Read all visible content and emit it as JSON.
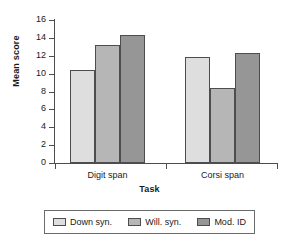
{
  "chart_data": {
    "type": "bar",
    "title": "",
    "xlabel": "Task",
    "ylabel": "Mean score",
    "categories": [
      "Digit span",
      "Corsi span"
    ],
    "series": [
      {
        "name": "Down syn.",
        "values": [
          10.4,
          11.9
        ],
        "color": "#dedede"
      },
      {
        "name": "Will. syn.",
        "values": [
          13.2,
          8.4
        ],
        "color": "#b6b6b6"
      },
      {
        "name": "Mod. ID",
        "values": [
          14.3,
          12.3
        ],
        "color": "#969696"
      }
    ],
    "ylim": [
      0,
      16
    ],
    "ytick_step": 2,
    "yticks": [
      0,
      2,
      4,
      6,
      8,
      10,
      12,
      14,
      16
    ],
    "ytick_labels": [
      "0",
      "2",
      "4",
      "6",
      "8",
      "10",
      "12",
      "14",
      "16"
    ],
    "grid": false,
    "legend_position": "bottom"
  }
}
